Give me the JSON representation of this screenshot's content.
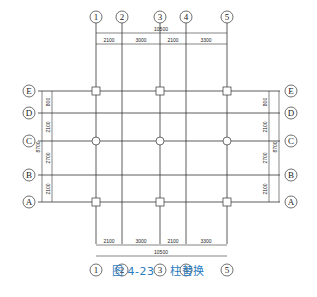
{
  "figure": {
    "caption_number": "图 4-23",
    "caption_title": "柱替换"
  },
  "axes": {
    "vertical": [
      {
        "label": "1",
        "x": 96
      },
      {
        "label": "2",
        "x": 122
      },
      {
        "label": "3",
        "x": 160
      },
      {
        "label": "4",
        "x": 186
      },
      {
        "label": "5",
        "x": 227
      }
    ],
    "horizontal": [
      {
        "label": "E",
        "y": 91
      },
      {
        "label": "D",
        "y": 113
      },
      {
        "label": "C",
        "y": 141
      },
      {
        "label": "B",
        "y": 175
      },
      {
        "label": "A",
        "y": 202
      }
    ]
  },
  "dimensions": {
    "top": {
      "total": "10500",
      "segments": [
        "2100",
        "3000",
        "2100",
        "3300"
      ]
    },
    "bottom": {
      "total": "10500",
      "segments": [
        "2100",
        "3000",
        "2100",
        "3300"
      ]
    },
    "left": {
      "total": "8700",
      "segments": [
        "800",
        "2100",
        "2700",
        "2100"
      ]
    },
    "right": {
      "total": "8700",
      "segments": [
        "800",
        "2100",
        "2700",
        "2100"
      ]
    }
  },
  "columns": {
    "square_at": [
      "E1",
      "E3",
      "E5",
      "A1",
      "A3",
      "A5"
    ],
    "circle_at": [
      "C1",
      "C3",
      "C5"
    ]
  },
  "colors": {
    "line": "#333333",
    "caption": "#2a7bbf"
  }
}
